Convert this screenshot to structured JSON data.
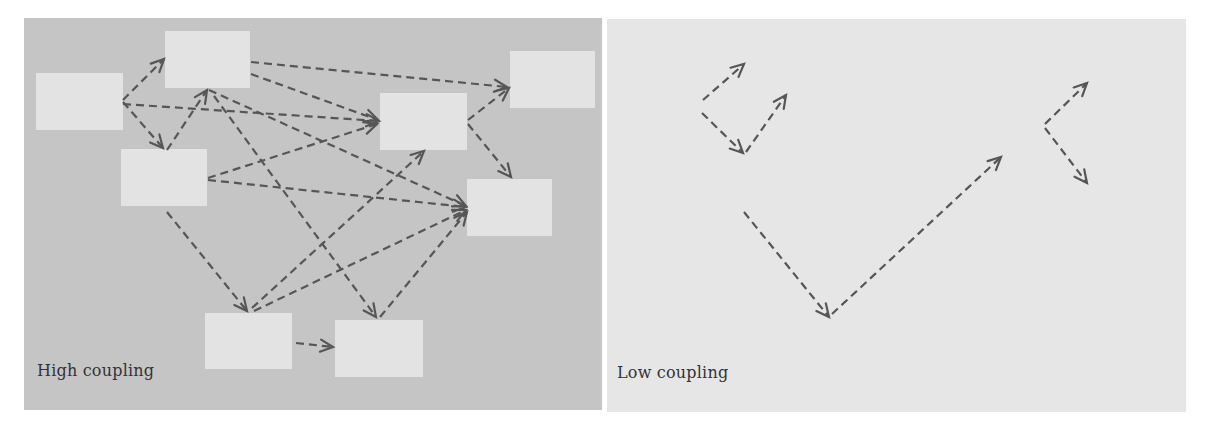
{
  "colors": {
    "page_bg": "#ffffff",
    "high_panel_bg": "#c5c5c5",
    "low_panel_bg": "#e6e6e6",
    "box_fill": "#e3e3e3",
    "arrow": "#565656",
    "label": "#333333"
  },
  "panels": [
    {
      "id": "high",
      "label": "High coupling",
      "rect": {
        "x": 24,
        "y": 18,
        "w": 578,
        "h": 392
      },
      "bg_key": "high_panel_bg",
      "label_pos": {
        "x": 37,
        "y": 376
      },
      "boxes": [
        {
          "id": "A",
          "x": 36,
          "y": 73,
          "w": 87,
          "h": 57
        },
        {
          "id": "B",
          "x": 165,
          "y": 31,
          "w": 85,
          "h": 57
        },
        {
          "id": "C",
          "x": 121,
          "y": 149,
          "w": 86,
          "h": 57
        },
        {
          "id": "D",
          "x": 380,
          "y": 93,
          "w": 87,
          "h": 57
        },
        {
          "id": "E",
          "x": 510,
          "y": 51,
          "w": 85,
          "h": 57
        },
        {
          "id": "F",
          "x": 467,
          "y": 179,
          "w": 85,
          "h": 57
        },
        {
          "id": "G",
          "x": 205,
          "y": 313,
          "w": 87,
          "h": 56
        },
        {
          "id": "H",
          "x": 335,
          "y": 320,
          "w": 88,
          "h": 57
        }
      ],
      "arrows": [
        {
          "from": [
            123,
            100
          ],
          "to": [
            164,
            59
          ]
        },
        {
          "from": [
            123,
            102
          ],
          "to": [
            163,
            148
          ]
        },
        {
          "from": [
            123,
            104
          ],
          "to": [
            379,
            121
          ]
        },
        {
          "from": [
            167,
            150
          ],
          "to": [
            207,
            90
          ]
        },
        {
          "from": [
            251,
            62
          ],
          "to": [
            507,
            87
          ]
        },
        {
          "from": [
            251,
            74
          ],
          "to": [
            378,
            120
          ]
        },
        {
          "from": [
            209,
            90
          ],
          "to": [
            466,
            206
          ]
        },
        {
          "from": [
            214,
            96
          ],
          "to": [
            376,
            317
          ]
        },
        {
          "from": [
            208,
            178
          ],
          "to": [
            377,
            124
          ]
        },
        {
          "from": [
            208,
            180
          ],
          "to": [
            466,
            207
          ]
        },
        {
          "from": [
            167,
            212
          ],
          "to": [
            247,
            311
          ]
        },
        {
          "from": [
            252,
            308
          ],
          "to": [
            424,
            151
          ]
        },
        {
          "from": [
            254,
            311
          ],
          "to": [
            466,
            210
          ]
        },
        {
          "from": [
            380,
            317
          ],
          "to": [
            467,
            212
          ]
        },
        {
          "from": [
            468,
            120
          ],
          "to": [
            509,
            88
          ]
        },
        {
          "from": [
            468,
            124
          ],
          "to": [
            511,
            177
          ]
        },
        {
          "from": [
            296,
            343
          ],
          "to": [
            333,
            347
          ]
        }
      ]
    },
    {
      "id": "low",
      "label": "Low coupling",
      "rect": {
        "x": 607,
        "y": 19,
        "w": 579,
        "h": 393
      },
      "bg_key": "low_panel_bg",
      "label_pos": {
        "x": 617,
        "y": 378
      },
      "boxes": [],
      "arrows": [
        {
          "from": [
            703,
            100
          ],
          "to": [
            744,
            64
          ]
        },
        {
          "from": [
            702,
            113
          ],
          "to": [
            743,
            153
          ]
        },
        {
          "from": [
            746,
            152
          ],
          "to": [
            786,
            95
          ]
        },
        {
          "from": [
            744,
            212
          ],
          "to": [
            829,
            317
          ]
        },
        {
          "from": [
            832,
            314
          ],
          "to": [
            1001,
            157
          ]
        },
        {
          "from": [
            1045,
            124
          ],
          "to": [
            1087,
            83
          ]
        },
        {
          "from": [
            1045,
            128
          ],
          "to": [
            1087,
            183
          ]
        }
      ]
    }
  ]
}
